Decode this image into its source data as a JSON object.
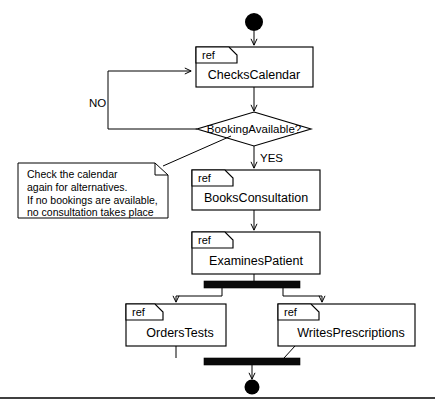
{
  "diagram": {
    "type": "uml-activity-diagram",
    "initial_node": {
      "name": "initial-node",
      "shape": "filled-circle"
    },
    "final_node": {
      "name": "final-node",
      "shape": "filled-circle"
    },
    "ref_frames": [
      {
        "id": "checks-calendar",
        "tag": "ref",
        "label": "ChecksCalendar"
      },
      {
        "id": "books-consultation",
        "tag": "ref",
        "label": "BooksConsultation"
      },
      {
        "id": "examines-patient",
        "tag": "ref",
        "label": "ExaminesPatient"
      },
      {
        "id": "orders-tests",
        "tag": "ref",
        "label": "OrdersTests"
      },
      {
        "id": "writes-prescriptions",
        "tag": "ref",
        "label": "WritesPrescriptions"
      }
    ],
    "decision": {
      "id": "booking-available",
      "label": "BookingAvailable?",
      "branches": [
        {
          "id": "branch-no",
          "label": "NO"
        },
        {
          "id": "branch-yes",
          "label": "YES"
        }
      ]
    },
    "note": {
      "id": "calendar-note",
      "lines": [
        "Check the calendar",
        "again for alternatives.",
        "If no bookings are available,",
        "no consultation takes place"
      ]
    },
    "bars": [
      {
        "id": "fork-bar",
        "kind": "fork"
      },
      {
        "id": "join-bar",
        "kind": "join"
      }
    ],
    "colors": {
      "stroke": "#000000",
      "fill": "#ffffff",
      "bar": "#0a0a0a"
    }
  }
}
